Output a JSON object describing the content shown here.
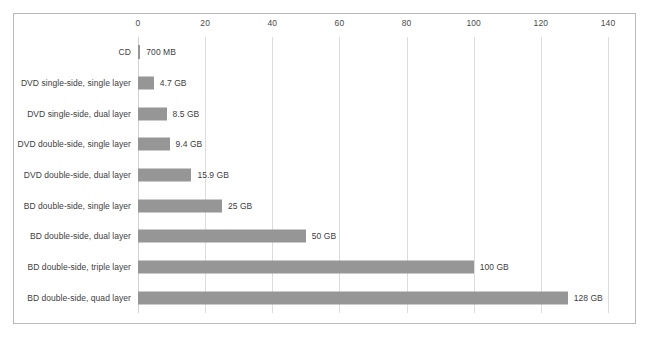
{
  "chart_data": {
    "type": "bar",
    "orientation": "horizontal",
    "title": "",
    "subtitle": "",
    "xlabel": "",
    "ylabel": "",
    "xlim": [
      0,
      140
    ],
    "xticks": [
      0,
      20,
      40,
      60,
      80,
      100,
      120,
      140
    ],
    "xtick_labels": [
      "0",
      "20",
      "40",
      "60",
      "80",
      "100",
      "120",
      "140"
    ],
    "grid": true,
    "grid_axis": "x",
    "legend": false,
    "legend_position": "none",
    "axis_position": "top",
    "bar_color": "#969696",
    "gridline_color": "#dcdcdc",
    "border_color": "#b8b8b8",
    "text_color": "#3d3d3d",
    "background": "#ffffff",
    "categories": [
      "CD",
      "DVD single-side, single layer",
      "DVD single-side, dual layer",
      "DVD double-side, single layer",
      "DVD double-side, dual layer",
      "BD double-side, single layer",
      "BD double-side, dual layer",
      "BD double-side, triple layer",
      "BD double-side, quad layer"
    ],
    "values": [
      0.7,
      4.7,
      8.5,
      9.4,
      15.9,
      25,
      50,
      100,
      128
    ],
    "data_labels": [
      "700 MB",
      "4.7 GB",
      "8.5 GB",
      "9.4 GB",
      "15.9 GB",
      "25 GB",
      "50 GB",
      "100 GB",
      "128 GB"
    ],
    "series": [
      {
        "name": "Capacity",
        "values": [
          0.7,
          4.7,
          8.5,
          9.4,
          15.9,
          25,
          50,
          100,
          128
        ]
      }
    ],
    "rows": [
      {
        "category": "CD",
        "value": 0.7,
        "label": "700 MB"
      },
      {
        "category": "DVD single-side, single layer",
        "value": 4.7,
        "label": "4.7 GB"
      },
      {
        "category": "DVD single-side, dual layer",
        "value": 8.5,
        "label": "8.5 GB"
      },
      {
        "category": "DVD double-side, single layer",
        "value": 9.4,
        "label": "9.4 GB"
      },
      {
        "category": "DVD double-side, dual layer",
        "value": 15.9,
        "label": "15.9 GB"
      },
      {
        "category": "BD double-side, single layer",
        "value": 25,
        "label": "25 GB"
      },
      {
        "category": "BD double-side, dual layer",
        "value": 50,
        "label": "50 GB"
      },
      {
        "category": "BD double-side, triple layer",
        "value": 100,
        "label": "100 GB"
      },
      {
        "category": "BD double-side, quad layer",
        "value": 128,
        "label": "128 GB"
      }
    ]
  }
}
